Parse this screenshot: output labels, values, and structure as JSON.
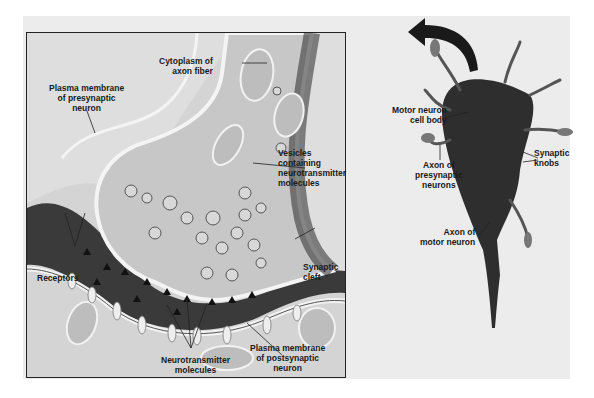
{
  "figure": {
    "left_panel": {
      "title": "Synapse detail",
      "labels": {
        "cytoplasm": [
          "Cytoplasm of",
          "axon fiber"
        ],
        "presynaptic_membrane": [
          "Plasma membrane",
          "of presynaptic",
          "neuron"
        ],
        "vesicles": [
          "Vesicles",
          "containing",
          "neurotransmitter",
          "molecules"
        ],
        "receptors": "Receptors",
        "synaptic_cleft": [
          "Synaptic",
          "cleft"
        ],
        "neurotransmitter": [
          "Neurotransmitter",
          "molecules"
        ],
        "postsynaptic_membrane": [
          "Plasma membrane",
          "of postsynaptic",
          "neuron"
        ]
      }
    },
    "right_panel": {
      "title": "Motor neuron",
      "labels": {
        "cell_body": [
          "Motor neuron",
          "cell body"
        ],
        "synaptic_knobs": [
          "Synaptic",
          "knobs"
        ],
        "presynaptic_axon": [
          "Axon of",
          "presynaptic",
          "neurons"
        ],
        "motor_axon": [
          "Axon of",
          "motor neuron"
        ]
      }
    },
    "colors": {
      "panel_bg": "#ececec",
      "inset_bg": "#dedede",
      "cell_dark": "#2e2e2e",
      "line": "#222222"
    }
  }
}
